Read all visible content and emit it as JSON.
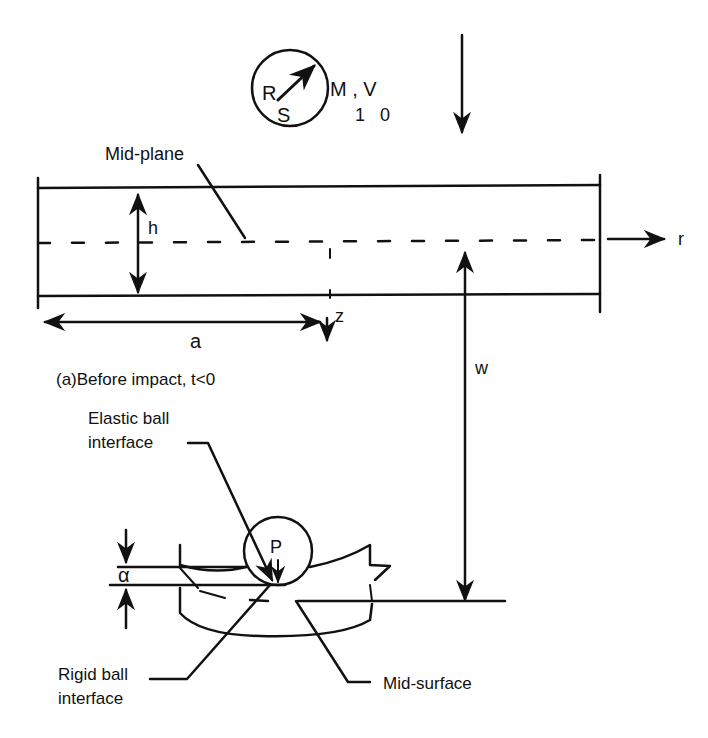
{
  "diagram": {
    "projectile": {
      "symbol_R": "R",
      "symbol_S": "S",
      "mass_velocity": "M , V",
      "subscripts": "1   0"
    },
    "plate": {
      "midplane_label": "Mid-plane",
      "thickness_label": "h",
      "radius_label": "a",
      "r_axis_label": "r",
      "z_axis_label": "z",
      "deflection_label": "w"
    },
    "caption": "(a)Before impact, t<0",
    "contact_detail": {
      "elastic_label_line1": "Elastic ball",
      "elastic_label_line2": "interface",
      "force_label": "P",
      "indent_label": "α",
      "rigid_label_line1": "Rigid ball",
      "rigid_label_line2": "interface",
      "midsurface_label": "Mid-surface"
    },
    "colors": {
      "ink": "#111111",
      "background": "#ffffff"
    }
  }
}
